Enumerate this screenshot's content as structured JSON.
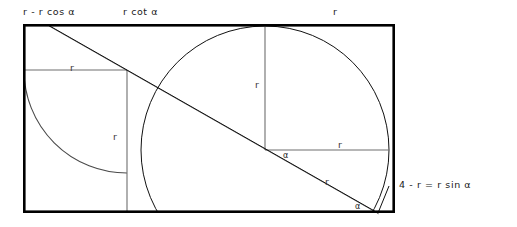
{
  "figure": {
    "background_color": "#ffffff",
    "frame_color": "#000000",
    "gray_color": "#6e6e6e",
    "curve_color": "#111111"
  },
  "labels": {
    "top_left": "r - r cos α",
    "top_mid": "r cot α",
    "top_right": "r",
    "left_rect_top": "r",
    "left_rect_side": "r",
    "circle_vertical": "r",
    "circle_horizontal": "r",
    "diagonal_lower": "r",
    "right_equation": "4 - r = r sin α",
    "angle_center": "α",
    "angle_corner": "α"
  },
  "geometry": {
    "outer_rect": {
      "x": 23,
      "y": 24,
      "width": 372,
      "height": 189
    },
    "left_arc": {
      "cx": 127,
      "cy": 70,
      "r": 103
    },
    "left_rect": {
      "x": 25,
      "y": 70,
      "width": 102,
      "height": 142
    },
    "big_circle": {
      "cx": 265,
      "cy": 150,
      "r": 124
    },
    "vertical_radius": {
      "x": 265,
      "y1": 25,
      "y2": 150
    },
    "horizontal_radius": {
      "y": 150,
      "x1": 265,
      "x2": 389
    },
    "diagonal": {
      "x1": 48,
      "y1": 25,
      "x2": 378,
      "y2": 213
    },
    "corner_segment": {
      "x1": 378,
      "y1": 213,
      "x2": 389,
      "y2": 188
    }
  }
}
